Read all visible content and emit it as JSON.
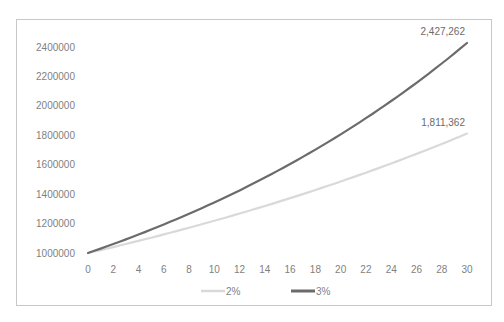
{
  "caption_partial": "",
  "chart_data": {
    "type": "line",
    "title": "",
    "xlabel": "",
    "ylabel": "",
    "x": [
      0,
      2,
      4,
      6,
      8,
      10,
      12,
      14,
      16,
      18,
      20,
      22,
      24,
      26,
      28,
      30
    ],
    "x_ticks": [
      "0",
      "2",
      "4",
      "6",
      "8",
      "10",
      "12",
      "14",
      "16",
      "18",
      "20",
      "22",
      "24",
      "26",
      "28",
      "30"
    ],
    "y_ticks": [
      "1000000",
      "1200000",
      "1400000",
      "1600000",
      "1800000",
      "2000000",
      "2200000",
      "2400000"
    ],
    "ylim": [
      1000000,
      2400000
    ],
    "xlim": [
      0,
      30
    ],
    "grid": false,
    "legend_position": "bottom",
    "series": [
      {
        "name": "2%",
        "color": "#d9d9d9",
        "width": 2.2,
        "values": [
          1000000,
          1040400,
          1082432,
          1126162,
          1171659,
          1218994,
          1268242,
          1319479,
          1372786,
          1428246,
          1485947,
          1545980,
          1608437,
          1673418,
          1741024,
          1811362
        ],
        "end_label": "1,811,362"
      },
      {
        "name": "3%",
        "color": "#6b6b6b",
        "width": 2.2,
        "values": [
          1000000,
          1060900,
          1125509,
          1194052,
          1266770,
          1343916,
          1425761,
          1512590,
          1604706,
          1702433,
          1806111,
          1916103,
          2032794,
          2156591,
          2287928,
          2427262
        ],
        "end_label": "2,427,262"
      }
    ]
  },
  "legend": {
    "items": [
      {
        "label": "2%"
      },
      {
        "label": "3%"
      }
    ]
  }
}
